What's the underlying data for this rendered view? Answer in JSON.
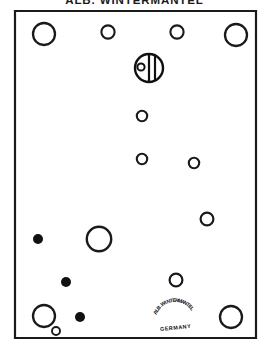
{
  "document": {
    "title": "ALB. WINTERMANTEL",
    "kind": "technical-plate-diagram",
    "background_color": "#ffffff",
    "ink_color": "#111111"
  },
  "frame": {
    "x": 15,
    "y": 11,
    "width": 241,
    "height": 327,
    "stroke_width": 2.2,
    "stroke_color": "#1a1a1a"
  },
  "brand_mark": {
    "arc_text": "ALB.WINTERMANTEL",
    "sub_text": "GERMANY",
    "center_x": 175,
    "center_y": 322,
    "arc_radius": 20,
    "arc_font_size": 5.2,
    "sub_font_size": 5.4,
    "rotation": -6
  },
  "emblem": {
    "label": "maker-emblem",
    "cx": 149,
    "cy": 68,
    "r": 14,
    "stroke_width": 2.4,
    "bar_left_x": 149,
    "bar_right_x": 155,
    "bar_stroke_width": 2.2,
    "dot_cx": 141,
    "dot_cy": 67,
    "dot_r": 3.6,
    "dot_stroke_width": 2.0
  },
  "chart_data": {
    "type": "scatter",
    "title": "ALB. WINTERMANTEL",
    "xlabel": "",
    "ylabel": "",
    "xlim": [
      15,
      256
    ],
    "ylim": [
      11,
      338
    ],
    "grid": false,
    "legend": null,
    "series": [
      {
        "name": "open",
        "fill": "none",
        "stroke": "#1a1a1a",
        "points": [
          {
            "id": "c1",
            "x": 44,
            "y": 34,
            "r": 11.0,
            "sw": 2.3
          },
          {
            "id": "c2",
            "x": 108,
            "y": 32,
            "r": 6.6,
            "sw": 2.1
          },
          {
            "id": "c3",
            "x": 177,
            "y": 32,
            "r": 6.6,
            "sw": 2.1
          },
          {
            "id": "c4",
            "x": 236,
            "y": 35,
            "r": 11.0,
            "sw": 2.3
          },
          {
            "id": "c5",
            "x": 142,
            "y": 116,
            "r": 5.2,
            "sw": 2.1
          },
          {
            "id": "c6",
            "x": 142,
            "y": 159,
            "r": 5.2,
            "sw": 2.1
          },
          {
            "id": "c7",
            "x": 194,
            "y": 163,
            "r": 5.2,
            "sw": 2.1
          },
          {
            "id": "c8",
            "x": 207,
            "y": 219,
            "r": 6.4,
            "sw": 2.2
          },
          {
            "id": "c9",
            "x": 99,
            "y": 239,
            "r": 12.2,
            "sw": 2.4
          },
          {
            "id": "c10",
            "x": 176,
            "y": 280,
            "r": 6.4,
            "sw": 2.2
          },
          {
            "id": "c11",
            "x": 44,
            "y": 316,
            "r": 11.0,
            "sw": 2.3
          },
          {
            "id": "c12",
            "x": 56,
            "y": 331,
            "r": 4.0,
            "sw": 1.9
          },
          {
            "id": "c13",
            "x": 231,
            "y": 317,
            "r": 11.0,
            "sw": 2.3
          }
        ]
      },
      {
        "name": "filled",
        "fill": "#111111",
        "stroke": "none",
        "points": [
          {
            "id": "d1",
            "x": 38,
            "y": 239,
            "r": 5.0
          },
          {
            "id": "d2",
            "x": 66,
            "y": 282,
            "r": 5.0
          },
          {
            "id": "d3",
            "x": 80,
            "y": 317,
            "r": 5.0
          },
          {
            "id": "d4",
            "x": 55,
            "y": 296,
            "r": 0.0
          }
        ]
      }
    ]
  }
}
